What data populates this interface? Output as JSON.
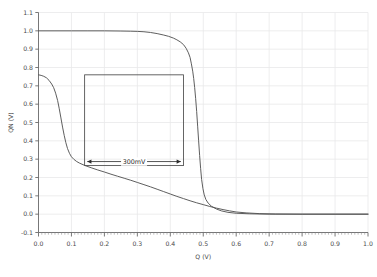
{
  "chart_data": {
    "type": "line",
    "title": "",
    "xlabel": "Q (V)",
    "ylabel": "QN (V)",
    "xlim": [
      0.0,
      1.0
    ],
    "ylim": [
      -0.1,
      1.1
    ],
    "xticks": [
      "0.0",
      "0.1",
      "0.2",
      "0.3",
      "0.4",
      "0.5",
      "0.6",
      "0.7",
      "0.8",
      "0.9",
      "1.0"
    ],
    "yticks": [
      "-0.1",
      "0.0",
      "0.1",
      "0.2",
      "0.3",
      "0.4",
      "0.5",
      "0.6",
      "0.7",
      "0.8",
      "0.9",
      "1.0",
      "1.1"
    ],
    "xtick_values": [
      0.0,
      0.1,
      0.2,
      0.3,
      0.4,
      0.5,
      0.6,
      0.7,
      0.8,
      0.9,
      1.0
    ],
    "ytick_values": [
      -0.1,
      0.0,
      0.1,
      0.2,
      0.3,
      0.4,
      0.5,
      0.6,
      0.7,
      0.8,
      0.9,
      1.0,
      1.1
    ],
    "minor_xticks": true,
    "grid": true,
    "grid_color": "#e8e8ea",
    "legend": "none",
    "curve_color": "#555555",
    "series": [
      {
        "name": "vtc-upper",
        "points": [
          [
            0.0,
            1.0
          ],
          [
            0.05,
            1.0
          ],
          [
            0.1,
            1.0
          ],
          [
            0.15,
            1.0
          ],
          [
            0.2,
            1.0
          ],
          [
            0.25,
            0.999
          ],
          [
            0.28,
            0.998
          ],
          [
            0.3,
            0.997
          ],
          [
            0.32,
            0.995
          ],
          [
            0.34,
            0.991
          ],
          [
            0.36,
            0.985
          ],
          [
            0.38,
            0.977
          ],
          [
            0.395,
            0.97
          ],
          [
            0.41,
            0.96
          ],
          [
            0.42,
            0.951
          ],
          [
            0.43,
            0.94
          ],
          [
            0.44,
            0.925
          ],
          [
            0.448,
            0.905
          ],
          [
            0.455,
            0.88
          ],
          [
            0.46,
            0.855
          ],
          [
            0.464,
            0.82
          ],
          [
            0.468,
            0.78
          ],
          [
            0.471,
            0.74
          ],
          [
            0.474,
            0.69
          ],
          [
            0.477,
            0.63
          ],
          [
            0.48,
            0.56
          ],
          [
            0.483,
            0.48
          ],
          [
            0.486,
            0.4
          ],
          [
            0.489,
            0.32
          ],
          [
            0.492,
            0.25
          ],
          [
            0.495,
            0.19
          ],
          [
            0.499,
            0.14
          ],
          [
            0.503,
            0.105
          ],
          [
            0.508,
            0.08
          ],
          [
            0.515,
            0.06
          ],
          [
            0.525,
            0.043
          ],
          [
            0.54,
            0.028
          ],
          [
            0.555,
            0.018
          ],
          [
            0.575,
            0.01
          ],
          [
            0.6,
            0.005
          ],
          [
            0.64,
            0.002
          ],
          [
            0.7,
            0.0
          ],
          [
            0.8,
            0.0
          ],
          [
            0.9,
            0.0
          ],
          [
            1.0,
            0.0
          ]
        ]
      },
      {
        "name": "vtc-lower",
        "points": [
          [
            0.0,
            0.76
          ],
          [
            0.008,
            0.757
          ],
          [
            0.016,
            0.752
          ],
          [
            0.024,
            0.744
          ],
          [
            0.032,
            0.73
          ],
          [
            0.04,
            0.71
          ],
          [
            0.046,
            0.69
          ],
          [
            0.052,
            0.66
          ],
          [
            0.058,
            0.62
          ],
          [
            0.063,
            0.575
          ],
          [
            0.068,
            0.525
          ],
          [
            0.073,
            0.475
          ],
          [
            0.078,
            0.43
          ],
          [
            0.083,
            0.39
          ],
          [
            0.088,
            0.358
          ],
          [
            0.094,
            0.332
          ],
          [
            0.1,
            0.313
          ],
          [
            0.108,
            0.298
          ],
          [
            0.116,
            0.287
          ],
          [
            0.125,
            0.278
          ],
          [
            0.14,
            0.266
          ],
          [
            0.16,
            0.253
          ],
          [
            0.18,
            0.241
          ],
          [
            0.2,
            0.23
          ],
          [
            0.22,
            0.218
          ],
          [
            0.24,
            0.207
          ],
          [
            0.26,
            0.196
          ],
          [
            0.28,
            0.185
          ],
          [
            0.3,
            0.173
          ],
          [
            0.32,
            0.161
          ],
          [
            0.34,
            0.149
          ],
          [
            0.36,
            0.136
          ],
          [
            0.38,
            0.123
          ],
          [
            0.4,
            0.11
          ],
          [
            0.42,
            0.097
          ],
          [
            0.44,
            0.085
          ],
          [
            0.46,
            0.073
          ],
          [
            0.48,
            0.062
          ],
          [
            0.5,
            0.052
          ],
          [
            0.52,
            0.042
          ],
          [
            0.54,
            0.033
          ],
          [
            0.56,
            0.025
          ],
          [
            0.58,
            0.018
          ],
          [
            0.6,
            0.012
          ],
          [
            0.63,
            0.007
          ],
          [
            0.67,
            0.003
          ],
          [
            0.72,
            0.001
          ],
          [
            0.8,
            0.0
          ],
          [
            0.9,
            0.0
          ],
          [
            1.0,
            0.0
          ]
        ]
      }
    ],
    "annotations": [
      {
        "name": "snm-box",
        "type": "rect",
        "x0": 0.14,
        "x1": 0.44,
        "y0": 0.265,
        "y1": 0.76
      },
      {
        "name": "snm-arrow",
        "type": "double-arrow",
        "label": "300mV",
        "x0": 0.148,
        "x1": 0.432,
        "y": 0.287
      }
    ]
  }
}
